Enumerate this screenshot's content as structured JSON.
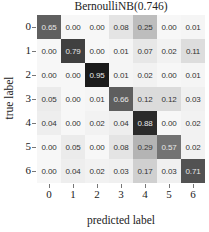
{
  "chart_data": {
    "type": "heatmap",
    "title": "BernoulliNB(0.746)",
    "xlabel": "predicted label",
    "ylabel": "true label",
    "x_tick_labels": [
      "0",
      "1",
      "2",
      "3",
      "4",
      "5",
      "6"
    ],
    "y_tick_labels": [
      "0",
      "1",
      "2",
      "3",
      "4",
      "5",
      "6"
    ],
    "values": [
      [
        0.65,
        0.0,
        0.0,
        0.08,
        0.25,
        0.0,
        0.01
      ],
      [
        0.0,
        0.79,
        0.0,
        0.01,
        0.07,
        0.02,
        0.11
      ],
      [
        0.0,
        0.0,
        0.95,
        0.01,
        0.02,
        0.0,
        0.01
      ],
      [
        0.05,
        0.0,
        0.01,
        0.66,
        0.12,
        0.12,
        0.03
      ],
      [
        0.04,
        0.0,
        0.02,
        0.04,
        0.88,
        0.0,
        0.02
      ],
      [
        0.0,
        0.05,
        0.0,
        0.08,
        0.29,
        0.57,
        0.02
      ],
      [
        0.0,
        0.04,
        0.02,
        0.03,
        0.17,
        0.03,
        0.71
      ]
    ],
    "colormap": "Greys",
    "value_format": "0.00",
    "vmin": 0,
    "vmax": 1,
    "grid": false,
    "legend": "none"
  }
}
